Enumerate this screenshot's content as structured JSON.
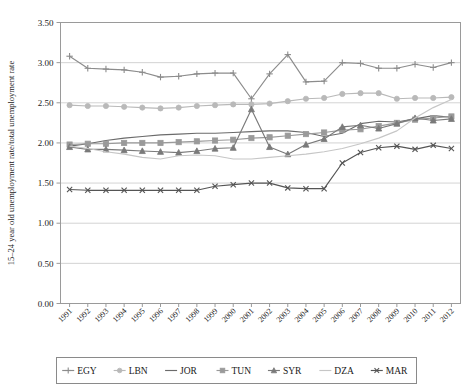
{
  "chart_data": {
    "type": "line",
    "title": "",
    "xlabel": "",
    "ylabel": "15–24 year old unemployment rate/total unemployment rate",
    "x": [
      1991,
      1992,
      1993,
      1994,
      1995,
      1996,
      1997,
      1998,
      1999,
      2000,
      2001,
      2002,
      2003,
      2004,
      2005,
      2006,
      2007,
      2008,
      2009,
      2010,
      2011,
      2012
    ],
    "categories": [
      "1991",
      "1992",
      "1993",
      "1994",
      "1995",
      "1996",
      "1997",
      "1998",
      "1999",
      "2000",
      "2001",
      "2002",
      "2003",
      "2004",
      "2005",
      "2006",
      "2007",
      "2008",
      "2009",
      "2010",
      "2011",
      "2012"
    ],
    "ylim": [
      0.0,
      3.5
    ],
    "yticks": [
      0.0,
      0.5,
      1.0,
      1.5,
      2.0,
      2.5,
      3.0,
      3.5
    ],
    "ytick_labels": [
      "0.00",
      "0.50",
      "1.00",
      "1.50",
      "2.00",
      "2.50",
      "3.00",
      "3.50"
    ],
    "grid": true,
    "legend_position": "bottom",
    "series": [
      {
        "name": "EGY",
        "color": "#8c8c8c",
        "marker": "plus",
        "values": [
          3.08,
          2.93,
          2.92,
          2.91,
          2.88,
          2.82,
          2.83,
          2.86,
          2.87,
          2.87,
          2.55,
          2.86,
          3.1,
          2.76,
          2.77,
          3.0,
          2.99,
          2.93,
          2.93,
          2.98,
          2.94,
          3.0
        ]
      },
      {
        "name": "LBN",
        "color": "#b9b9b9",
        "marker": "circle",
        "values": [
          2.47,
          2.46,
          2.46,
          2.45,
          2.44,
          2.43,
          2.44,
          2.46,
          2.47,
          2.48,
          2.48,
          2.49,
          2.52,
          2.55,
          2.56,
          2.61,
          2.62,
          2.62,
          2.55,
          2.56,
          2.56,
          2.57
        ]
      },
      {
        "name": "JOR",
        "color": "#6b6b6b",
        "marker": "none",
        "values": [
          1.96,
          1.99,
          2.03,
          2.06,
          2.08,
          2.1,
          2.11,
          2.12,
          2.12,
          2.13,
          2.14,
          2.15,
          2.15,
          2.13,
          2.08,
          2.12,
          2.24,
          2.27,
          2.26,
          2.3,
          2.34,
          2.32
        ]
      },
      {
        "name": "TUN",
        "color": "#9a9a9a",
        "marker": "square",
        "values": [
          1.98,
          1.99,
          1.99,
          2.0,
          2.0,
          2.0,
          2.01,
          2.02,
          2.03,
          2.04,
          2.06,
          2.07,
          2.09,
          2.11,
          2.13,
          2.16,
          2.17,
          2.21,
          2.25,
          2.29,
          2.31,
          2.33
        ]
      },
      {
        "name": "SYR",
        "color": "#7a7a7a",
        "marker": "triangle",
        "values": [
          1.95,
          1.92,
          1.92,
          1.91,
          1.9,
          1.89,
          1.88,
          1.9,
          1.93,
          1.94,
          2.42,
          1.95,
          1.86,
          1.98,
          2.05,
          2.2,
          2.22,
          2.18,
          2.24,
          2.31,
          2.28,
          2.3
        ]
      },
      {
        "name": "DZA",
        "color": "#c6c6c6",
        "marker": "none",
        "values": [
          1.96,
          1.93,
          1.89,
          1.86,
          1.82,
          1.8,
          1.84,
          1.85,
          1.84,
          1.8,
          1.8,
          1.82,
          1.84,
          1.86,
          1.89,
          1.93,
          1.99,
          2.06,
          2.15,
          2.31,
          2.44,
          2.54
        ]
      },
      {
        "name": "MAR",
        "color": "#555555",
        "marker": "x",
        "values": [
          1.42,
          1.41,
          1.41,
          1.41,
          1.41,
          1.41,
          1.41,
          1.41,
          1.46,
          1.48,
          1.5,
          1.5,
          1.44,
          1.43,
          1.43,
          1.75,
          1.88,
          1.94,
          1.96,
          1.92,
          1.97,
          1.93
        ]
      }
    ]
  },
  "axes": {
    "frame_color": "#9a9a9a",
    "grid_color": "#c8c8c8",
    "text_color": "#1a1a1a"
  },
  "legend": {
    "entries": [
      "EGY",
      "LBN",
      "JOR",
      "TUN",
      "SYR",
      "DZA",
      "MAR"
    ],
    "border_color": "#8a8a8a"
  }
}
